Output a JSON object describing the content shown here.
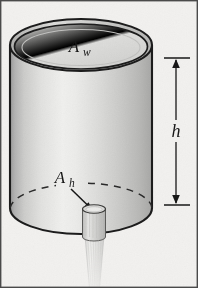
{
  "figure": {
    "background_color": "#f2f1ef",
    "frame_color": "#4a4a4a",
    "ink_color": "#1c1c1c",
    "labels": {
      "water_surface_area": {
        "symbol": "A",
        "subscript": "w",
        "name": "A_w"
      },
      "hole_area": {
        "symbol": "A",
        "subscript": "h",
        "name": "A_h"
      },
      "height": {
        "symbol": "h",
        "name": "h"
      }
    },
    "parts": {
      "tank_label": "cylindrical tank",
      "top_rim_label": "tank rim",
      "bottom_hidden_edge_label": "hidden bottom edge",
      "spout_label": "drain spout",
      "stream_label": "water stream",
      "dimension_label": "height dimension line",
      "leader_label": "leader arrow to hole"
    },
    "geometry": {
      "canvas_width": 198,
      "canvas_height": 288,
      "cylinder_left": 10,
      "cylinder_right": 152,
      "top_ellipse_cy": 45,
      "bottom_ellipse_cy": 208,
      "ellipse_rx": 71,
      "ellipse_ry": 26,
      "dimension_x": 176,
      "dimension_top_y": 58,
      "dimension_bottom_y": 205
    }
  }
}
